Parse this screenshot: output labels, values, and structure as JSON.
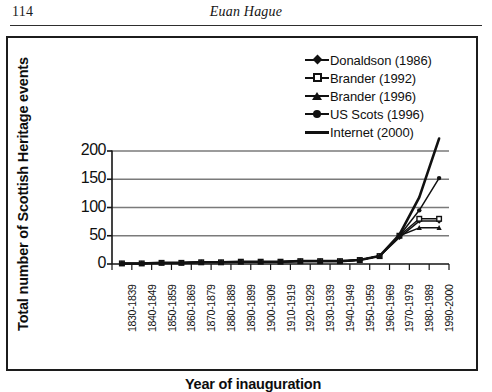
{
  "page": {
    "number": "114",
    "running_head": "Euan Hague"
  },
  "chart_data": {
    "type": "line",
    "title": "",
    "xlabel": "Year  of inauguration",
    "ylabel": "Total number of Scottish Heritage events",
    "ylim": [
      0,
      225
    ],
    "yticks": [
      0,
      50,
      100,
      150,
      200
    ],
    "ytick_labels": [
      "0",
      "50",
      "100",
      "150",
      "200"
    ],
    "grid": "horizontal",
    "legend_position": "top-right",
    "categories": [
      "1830-1839",
      "1840-1849",
      "1850-1859",
      "1860-1869",
      "1870-1879",
      "1880-1889",
      "1890-1899",
      "1900-1909",
      "1910-1919",
      "1920-1929",
      "1930-1939",
      "1940-1949",
      "1950-1959",
      "1960-1969",
      "1970-1979",
      "1980-1989",
      "1990-2000"
    ],
    "series": [
      {
        "name": "Donaldson (1986)",
        "marker": "diamond",
        "values": [
          1,
          1,
          2,
          2,
          3,
          3,
          4,
          4,
          4,
          5,
          5,
          5,
          7,
          14,
          47,
          76,
          76
        ]
      },
      {
        "name": "Brander (1992)",
        "marker": "open-square",
        "values": [
          1,
          1,
          2,
          2,
          3,
          3,
          4,
          4,
          4,
          5,
          5,
          5,
          7,
          14,
          50,
          80,
          80
        ]
      },
      {
        "name": "Brander (1996)",
        "marker": "triangle",
        "values": [
          1,
          1,
          2,
          2,
          3,
          3,
          4,
          4,
          4,
          5,
          5,
          5,
          7,
          14,
          50,
          64,
          64
        ]
      },
      {
        "name": "US Scots (1996)",
        "marker": "circle",
        "values": [
          1,
          1,
          2,
          2,
          3,
          3,
          4,
          4,
          4,
          5,
          5,
          5,
          7,
          14,
          50,
          95,
          152
        ]
      },
      {
        "name": "Internet (2000)",
        "marker": "none",
        "values": [
          1,
          1,
          2,
          2,
          3,
          3,
          4,
          4,
          4,
          5,
          5,
          5,
          7,
          14,
          52,
          118,
          222
        ]
      }
    ]
  }
}
